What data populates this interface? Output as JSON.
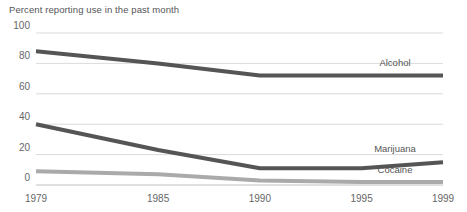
{
  "chart_data": {
    "type": "line",
    "title": "Percent reporting use in the past month",
    "xlabel": "",
    "ylabel": "",
    "ylim": [
      0,
      100
    ],
    "xlim": [
      1979,
      1999
    ],
    "grid": true,
    "legend_position": "right-inline",
    "yticks": [
      0,
      20,
      40,
      60,
      80,
      100
    ],
    "ytick_labels": [
      "0",
      "20",
      "40",
      "60",
      "80",
      "100"
    ],
    "xticks": [
      1979,
      1985,
      1990,
      1995,
      1999
    ],
    "xtick_labels": [
      "1979",
      "1985",
      "1990",
      "1995",
      "1999"
    ],
    "x": [
      1979,
      1985,
      1990,
      1995,
      1999
    ],
    "series": [
      {
        "name": "Alcohol",
        "label": "Alcohol",
        "color": "#555555",
        "values": [
          88,
          80,
          72,
          72,
          72
        ]
      },
      {
        "name": "Marijuana",
        "label": "Marijuana",
        "color": "#555555",
        "values": [
          40,
          23,
          11,
          11,
          15
        ]
      },
      {
        "name": "Cocaine",
        "label": "Cocaine",
        "color": "#aaaaaa",
        "values": [
          9,
          7,
          3,
          2,
          2
        ]
      }
    ],
    "colors": {
      "alcohol": "#555555",
      "marijuana": "#555555",
      "cocaine": "#aaaaaa",
      "gridline": "#cccccc",
      "axis": "#b0b0b0",
      "text": "#666666",
      "title": "#555555",
      "background": "#ffffff"
    }
  }
}
